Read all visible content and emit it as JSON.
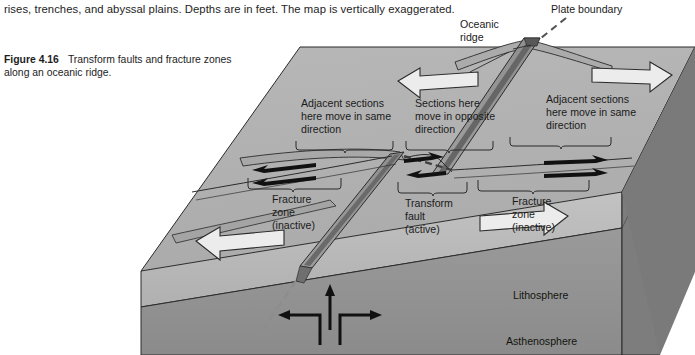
{
  "page": {
    "running_text": "rises, trenches, and abyssal plains. Depths are in feet. The map is vertically exaggerated."
  },
  "caption": {
    "figure_label": "Figure 4.16",
    "text": "Transform faults and fracture zones along an oceanic ridge."
  },
  "diagram": {
    "title": "Transform faults and fracture zones along an oceanic ridge",
    "callouts": {
      "oceanic_ridge": "Oceanic\nridge",
      "oceanic_ridge_line1": "Oceanic",
      "oceanic_ridge_line2": "ridge",
      "plate_boundary": "Plate boundary"
    },
    "bracket_labels": {
      "left_top_line1": "Adjacent sections",
      "left_top_line2": "here move in same",
      "left_top_line3": "direction",
      "center_top_line1": "Sections here",
      "center_top_line2": "move in opposite",
      "center_top_line3": "direction",
      "right_top_line1": "Adjacent sections",
      "right_top_line2": "here move in same",
      "right_top_line3": "direction",
      "left_bottom_line1": "Fracture",
      "left_bottom_line2": "zone",
      "left_bottom_line3": "(inactive)",
      "center_bottom_line1": "Transform",
      "center_bottom_line2": "fault",
      "center_bottom_line3": "(active)",
      "right_bottom_line1": "Fracture",
      "right_bottom_line2": "zone",
      "right_bottom_line3": "(inactive)"
    },
    "layers": {
      "lithosphere": "Lithosphere",
      "asthenosphere": "Asthenosphere"
    },
    "colors": {
      "top_surface": "#b3b3b3",
      "lithosphere_face": "#b8b8b8",
      "asthenosphere_face": "#8f8f8f",
      "right_face_dark": "#7a7a7a",
      "ridge_flank": "#9d9d9d",
      "rift_valley": "#6d6d6d",
      "outline": "#2b2b2b",
      "arrow_white_fill": "#e8e8e8",
      "arrow_black": "#111111",
      "plate_boundary_dash": "#8a8a8a"
    },
    "motion_arrows": {
      "left_plate": "left",
      "right_plate_top": "right",
      "right_plate_bottom": "right",
      "left_plate_bottom": "left",
      "fracture_zone_left": "both-same-left",
      "fracture_zone_right": "both-same-right",
      "transform_fault": "opposite"
    }
  }
}
